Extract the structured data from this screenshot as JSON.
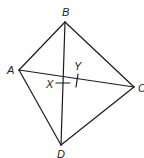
{
  "diagram": {
    "type": "quadrilateral-with-diagonals",
    "stroke_color": "#1a1a1a",
    "vertices": [
      {
        "label": "A",
        "x": 19,
        "y": 70,
        "lx": 7,
        "ly": 74
      },
      {
        "label": "B",
        "x": 65,
        "y": 22,
        "lx": 62,
        "ly": 16
      },
      {
        "label": "C",
        "x": 134,
        "y": 87,
        "lx": 138,
        "ly": 92
      },
      {
        "label": "D",
        "x": 61,
        "y": 145,
        "lx": 57,
        "ly": 158
      }
    ],
    "points": [
      {
        "label": "X",
        "lx": 46,
        "ly": 88
      },
      {
        "label": "Y",
        "lx": 74,
        "ly": 70
      }
    ],
    "labels": {
      "A": "A",
      "B": "B",
      "C": "C",
      "D": "D",
      "X": "X",
      "Y": "Y"
    }
  }
}
